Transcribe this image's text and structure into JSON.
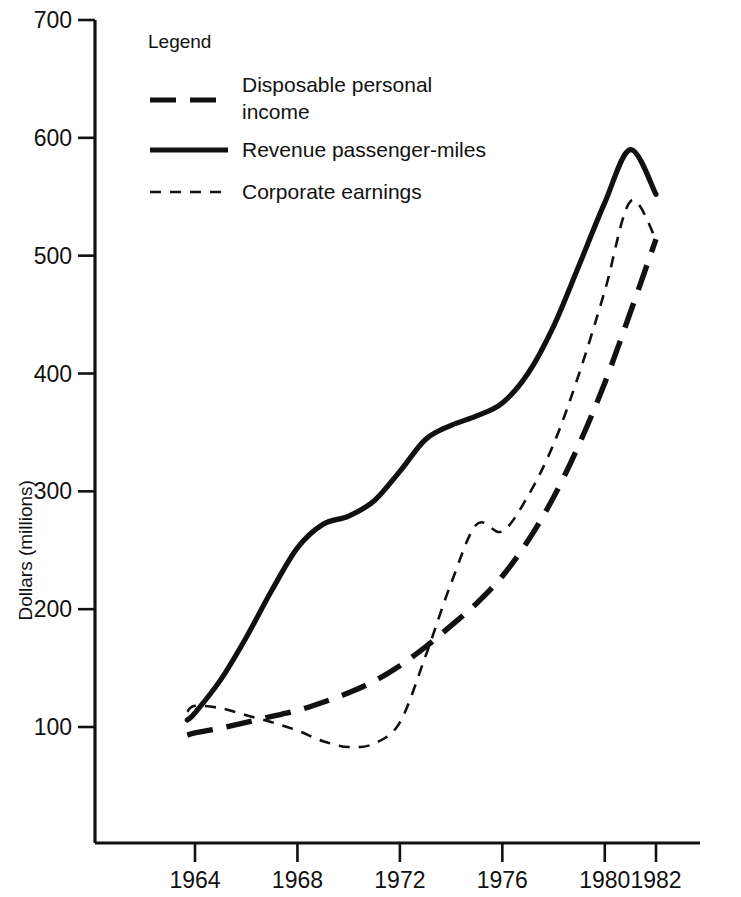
{
  "chart_data": {
    "type": "line",
    "title": "",
    "xlabel": "",
    "ylabel": "Dollars (millions)",
    "ylim": [
      0,
      700
    ],
    "xlim": [
      1962.8,
      1982.2
    ],
    "grid": false,
    "y_ticks": [
      100,
      200,
      300,
      400,
      500,
      600,
      700
    ],
    "y_tick_labels": [
      "100",
      "200",
      "300",
      "400",
      "500",
      "600",
      "700"
    ],
    "x_ticks": [
      1964,
      1968,
      1972,
      1976,
      1980,
      1982
    ],
    "x_tick_labels": [
      "1964",
      "1968",
      "1972",
      "1976",
      "1980",
      "1982"
    ],
    "legend": {
      "title": "Legend",
      "position": "upper-left-inside",
      "entries": [
        {
          "label": "Disposable personal income",
          "style": "long-dash",
          "width": 5
        },
        {
          "label": "Revenue passenger-miles",
          "style": "solid",
          "width": 5
        },
        {
          "label": "Corporate earnings",
          "style": "short-dash",
          "width": 2.4
        }
      ]
    },
    "series": [
      {
        "name": "Disposable personal income",
        "style": "long-dash",
        "x": [
          1963.7,
          1964,
          1965,
          1966,
          1967,
          1968,
          1969,
          1970,
          1971,
          1972,
          1973,
          1974,
          1975,
          1976,
          1977,
          1978,
          1979,
          1980,
          1981,
          1982
        ],
        "values": [
          93,
          95,
          99,
          104,
          109,
          114,
          121,
          129,
          139,
          152,
          168,
          186,
          205,
          228,
          258,
          295,
          340,
          392,
          452,
          514
        ]
      },
      {
        "name": "Revenue passenger-miles",
        "style": "solid",
        "x": [
          1963.7,
          1964,
          1965,
          1966,
          1967,
          1968,
          1969,
          1970,
          1971,
          1972,
          1973,
          1974,
          1975,
          1976,
          1977,
          1978,
          1979,
          1980,
          1981,
          1982
        ],
        "values": [
          106,
          112,
          140,
          176,
          216,
          252,
          272,
          279,
          292,
          317,
          344,
          356,
          364,
          375,
          400,
          440,
          492,
          545,
          590,
          552
        ]
      },
      {
        "name": "Corporate earnings",
        "style": "short-dash",
        "x": [
          1963.7,
          1964,
          1965,
          1966,
          1967,
          1968,
          1969,
          1970,
          1971,
          1972,
          1973,
          1974,
          1975,
          1976,
          1977,
          1978,
          1979,
          1980,
          1981,
          1982
        ],
        "values": [
          113,
          118,
          116,
          110,
          104,
          97,
          88,
          83,
          86,
          104,
          160,
          222,
          272,
          266,
          296,
          340,
          400,
          470,
          546,
          514
        ]
      }
    ]
  }
}
